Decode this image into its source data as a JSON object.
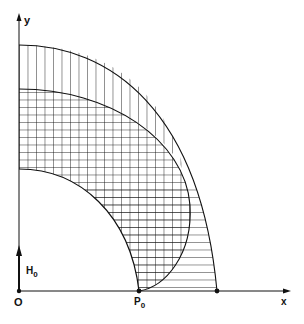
{
  "diagram": {
    "type": "hatched regions in first quadrant",
    "axes": {
      "x_label": "x",
      "y_label": "y",
      "origin_label": "O"
    },
    "points": {
      "p0_label": "P",
      "p0_sub": "0",
      "h0_label": "H",
      "h0_sub": "0"
    },
    "regions": [
      {
        "name": "vertical-hatch-region",
        "hatch": "vertical"
      },
      {
        "name": "horizontal-hatch-region",
        "hatch": "horizontal"
      },
      {
        "name": "cross-hatch-region",
        "hatch": "cross"
      },
      {
        "name": "inner-blank-region",
        "hatch": "none"
      }
    ],
    "colors": {
      "line": "#111111",
      "background": "#ffffff"
    }
  }
}
